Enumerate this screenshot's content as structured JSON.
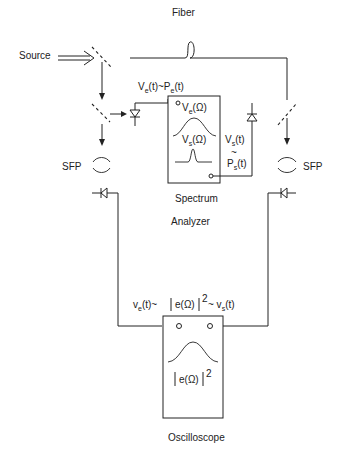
{
  "diagram": {
    "labels": {
      "source": "Source",
      "fiber": "Fiber",
      "sfp_left": "SFP",
      "sfp_right": "SFP",
      "ve_pe": "V",
      "ve_pe_sub1": "e",
      "ve_pe_mid": "(t)~P",
      "ve_pe_sub2": "e",
      "ve_pe_end": "(t)",
      "sa_ve": "V",
      "sa_ve_sub": "e",
      "sa_ve_end": "(Ω)",
      "sa_vs": "V",
      "sa_vs_sub": "s",
      "sa_vs_end": "(Ω)",
      "vs_t": "V",
      "vs_t_sub": "s",
      "vs_t_end": "(t)",
      "tilde": "~",
      "ps_t": "P",
      "ps_t_sub": "s",
      "ps_t_end": "(t)",
      "spectrum": "Spectrum",
      "analyzer": "Analyzer",
      "osc_eq_a": "v",
      "osc_eq_a_sub": "e",
      "osc_eq_b": "(t)~",
      "osc_eq_c": "e(Ω)",
      "osc_eq_sup": "2",
      "osc_eq_d": "~ v",
      "osc_eq_d_sub": "s",
      "osc_eq_e": "(t)",
      "osc_screen": "e(Ω)",
      "osc_screen_sup": "2",
      "oscilloscope": "Oscilloscope"
    },
    "components": [
      "source",
      "beam-splitter-top",
      "beam-splitter-reference",
      "fiber-loop",
      "beam-splitter-signal",
      "photodiode-reference",
      "photodiode-signal",
      "spectrum-analyzer",
      "sfp-left",
      "sfp-right",
      "photodiode-sfp-left",
      "photodiode-sfp-right",
      "oscilloscope"
    ]
  }
}
